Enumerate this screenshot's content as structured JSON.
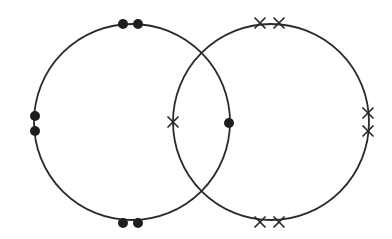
{
  "diagram": {
    "type": "two-overlapping-circles-with-markers",
    "canvas": {
      "width": 392,
      "height": 239,
      "background": "#ffffff"
    },
    "stroke_color": "#2a2a2a",
    "circles": [
      {
        "id": "left-circle",
        "cx": 132,
        "cy": 122,
        "r": 98,
        "marker_type": "dot",
        "markers": [
          {
            "x": 123,
            "y": 24
          },
          {
            "x": 138,
            "y": 24
          },
          {
            "x": 35,
            "y": 116
          },
          {
            "x": 35,
            "y": 131
          },
          {
            "x": 123,
            "y": 223
          },
          {
            "x": 138,
            "y": 223
          },
          {
            "x": 229,
            "y": 123
          }
        ]
      },
      {
        "id": "right-circle",
        "cx": 271,
        "cy": 122,
        "r": 98,
        "marker_type": "cross",
        "markers": [
          {
            "x": 260,
            "y": 23
          },
          {
            "x": 279,
            "y": 23
          },
          {
            "x": 368,
            "y": 113
          },
          {
            "x": 368,
            "y": 131
          },
          {
            "x": 260,
            "y": 222
          },
          {
            "x": 279,
            "y": 222
          },
          {
            "x": 173,
            "y": 122
          }
        ]
      }
    ]
  }
}
